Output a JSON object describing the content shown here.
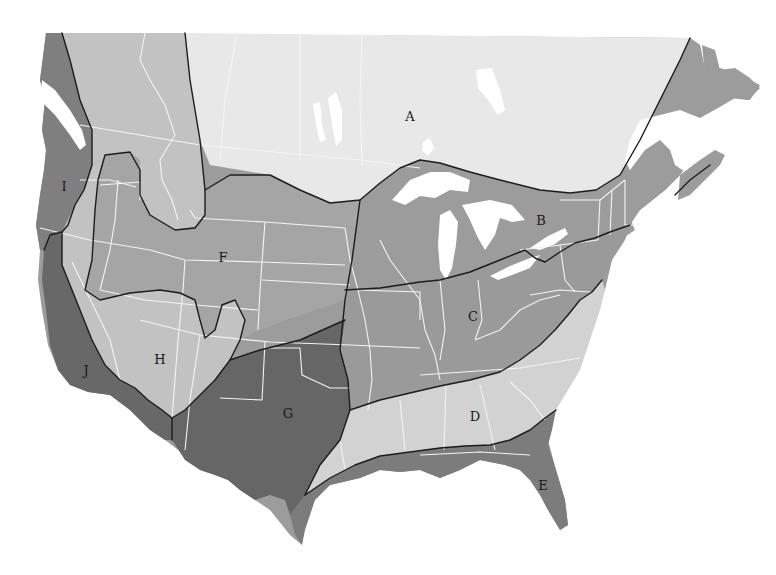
{
  "map": {
    "type": "regional zone map",
    "area": "United States and southern Canada",
    "colors": {
      "background": "#ffffff",
      "zone_very_light": "#e8e8e8",
      "zone_light": "#d2d2d2",
      "zone_mid_light": "#bcbcbc",
      "zone_mid": "#9c9c9c",
      "zone_dark": "#7c7c7c",
      "zone_darkest": "#666666",
      "boundary_line": "#1c1c1c",
      "state_line": "#f4f4f4"
    },
    "regions": [
      {
        "id": "A",
        "label": "A",
        "shade": "very light",
        "x": 410,
        "y": 116
      },
      {
        "id": "B",
        "label": "B",
        "shade": "medium",
        "x": 541,
        "y": 220
      },
      {
        "id": "C",
        "label": "C",
        "shade": "medium",
        "x": 473,
        "y": 316
      },
      {
        "id": "D",
        "label": "D",
        "shade": "light",
        "x": 475,
        "y": 416
      },
      {
        "id": "E",
        "label": "E",
        "shade": "dark",
        "x": 543,
        "y": 485
      },
      {
        "id": "F",
        "label": "F",
        "shade": "medium",
        "x": 223,
        "y": 257
      },
      {
        "id": "G",
        "label": "G",
        "shade": "darkest",
        "x": 288,
        "y": 413
      },
      {
        "id": "H",
        "label": "H",
        "shade": "light",
        "x": 160,
        "y": 359
      },
      {
        "id": "I",
        "label": "I",
        "shade": "dark",
        "x": 64,
        "y": 186
      },
      {
        "id": "J",
        "label": "J",
        "shade": "darkest",
        "x": 86,
        "y": 370
      }
    ]
  }
}
